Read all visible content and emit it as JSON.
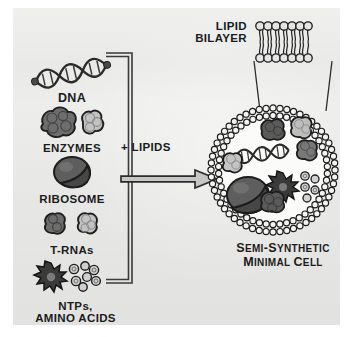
{
  "figure": {
    "title": "Semi-Synthetic Minimal Cell",
    "background_color": "#e9e9e7",
    "ink_color": "#1b1b1b"
  },
  "components": {
    "list_heading": "Components",
    "items": [
      {
        "id": "dna",
        "label": "DNA",
        "icon": "dna-double-helix-icon",
        "shade": "dark"
      },
      {
        "id": "enzymes",
        "label": "ENZYMES",
        "icon": "protein-blob-pair-icon",
        "shade": "mixed"
      },
      {
        "id": "ribosome",
        "label": "RIBOSOME",
        "icon": "ribosome-subunits-icon",
        "shade": "dark"
      },
      {
        "id": "trnas",
        "label": "T-RNAs",
        "icon": "trna-blob-pair-icon",
        "shade": "mixed"
      },
      {
        "id": "ntps",
        "label": "NTPs,\nAMINO ACIDS",
        "label_line1": "NTPs,",
        "label_line2": "AMINO ACIDS",
        "icon": "ntp-star-cluster-icon",
        "shade": "dark"
      }
    ]
  },
  "reaction": {
    "bracket": "grouping-bracket",
    "arrow_label": "+ LIPIDS",
    "arrow": "right-arrow"
  },
  "membrane": {
    "callout_label_line1": "LIPID",
    "callout_label_line2": "BILAYER",
    "inset": "phospholipid-bilayer-inset",
    "head_count_per_leaflet": 7
  },
  "cell": {
    "caption_line1": "SEMI-SYNTHETIC",
    "caption_line2": "MINIMAL CELL",
    "caption_line1_parts": [
      {
        "t": "S",
        "cap": true
      },
      {
        "t": "EMI",
        "cap": false
      },
      {
        "t": "-",
        "cap": true
      },
      {
        "t": "S",
        "cap": true
      },
      {
        "t": "YNTHETIC",
        "cap": false
      }
    ],
    "caption_line2_parts": [
      {
        "t": "M",
        "cap": true
      },
      {
        "t": "INIMAL",
        "cap": false
      },
      {
        "t": " ",
        "cap": false
      },
      {
        "t": "C",
        "cap": true
      },
      {
        "t": "ELL",
        "cap": false
      }
    ],
    "interior_contents": [
      "dna-double-helix",
      "enzyme-blob-dark",
      "enzyme-blob-light",
      "enzyme-blob-mid",
      "ribosome",
      "ntp-star",
      "ntp-circles",
      "trna-blob"
    ]
  }
}
